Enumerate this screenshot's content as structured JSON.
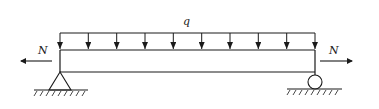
{
  "diagram": {
    "type": "simply-supported beam with uniform distributed load and axial forces",
    "labels": {
      "distributed_load": "q",
      "axial_force_left": "N",
      "axial_force_right": "N"
    },
    "supports": {
      "left": "pin",
      "right": "roller"
    },
    "load_arrow_count": 10,
    "colors": {
      "line": "#1a1a1a",
      "background": "#ffffff"
    }
  }
}
